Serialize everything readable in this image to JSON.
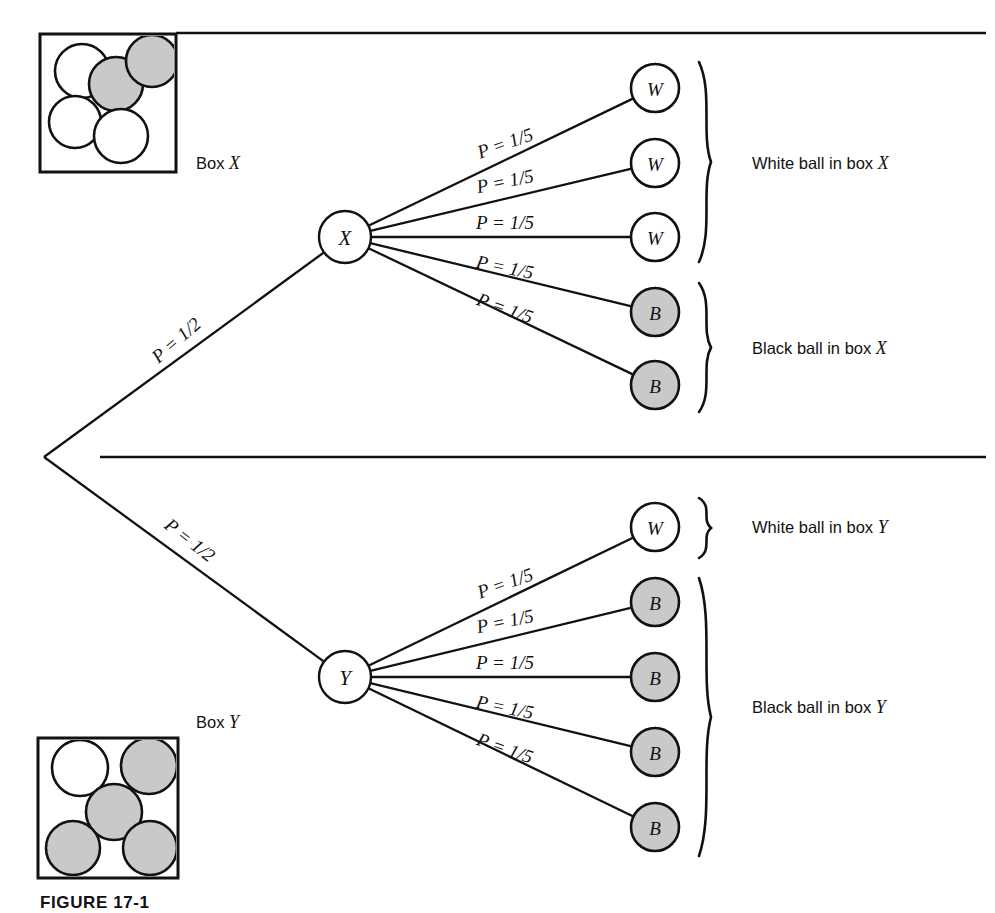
{
  "figure": {
    "caption": "FIGURE 17-1"
  },
  "colors": {
    "ink": "#111111",
    "paper": "#ffffff",
    "black_ball_fill": "#c9c9c9",
    "white_ball_fill": "#ffffff"
  },
  "boxes": [
    {
      "id": "box-x",
      "label": "Box X",
      "label_name": "Box",
      "label_italic": "X",
      "balls": [
        {
          "color": "white",
          "cx": 82,
          "cy": 71,
          "r": 27
        },
        {
          "color": "white",
          "cx": 75,
          "cy": 122,
          "r": 26
        },
        {
          "color": "black",
          "cx": 116,
          "cy": 84,
          "r": 27
        },
        {
          "color": "black",
          "cx": 152,
          "cy": 61,
          "r": 26
        },
        {
          "color": "white",
          "cx": 121,
          "cy": 136,
          "r": 27
        }
      ]
    },
    {
      "id": "box-y",
      "label": "Box Y",
      "label_name": "Box",
      "label_italic": "Y",
      "balls": [
        {
          "color": "white",
          "cx": 80,
          "cy": 768,
          "r": 28
        },
        {
          "color": "black",
          "cx": 149,
          "cy": 766,
          "r": 28
        },
        {
          "color": "black",
          "cx": 114,
          "cy": 812,
          "r": 28
        },
        {
          "color": "black",
          "cx": 73,
          "cy": 848,
          "r": 27
        },
        {
          "color": "black",
          "cx": 150,
          "cy": 848,
          "r": 27
        }
      ]
    }
  ],
  "dividers": [
    {
      "name": "top-divider",
      "x1": 176,
      "y1": 33,
      "x2": 986,
      "y2": 33
    },
    {
      "name": "middle-divider",
      "x1": 100,
      "y1": 457,
      "x2": 986,
      "y2": 457
    }
  ],
  "root": {
    "x": 44,
    "y": 457
  },
  "first_stage": [
    {
      "id": "branch-to-x",
      "label": "P = 1/2",
      "probability": "1/2",
      "to_node": "X",
      "label_x": 176,
      "label_y": 340,
      "rotation": -41
    },
    {
      "id": "branch-to-y",
      "label": "P = 1/2",
      "probability": "1/2",
      "to_node": "Y",
      "label_x": 190,
      "label_y": 540,
      "rotation": 38
    }
  ],
  "nodes": [
    {
      "id": "node-x",
      "letter": "X",
      "cx": 345,
      "cy": 237,
      "r": 26
    },
    {
      "id": "node-y",
      "letter": "Y",
      "cx": 345,
      "cy": 677,
      "r": 26
    }
  ],
  "upper_branches": {
    "from_node": "X",
    "items": [
      {
        "index": 1,
        "label": "P = 1/5",
        "probability": "1/5",
        "outcome": "W",
        "ball": "white",
        "tx": 655,
        "ty": 88,
        "lx": 505,
        "ly": 143,
        "rot": -19.5
      },
      {
        "index": 2,
        "label": "P = 1/5",
        "probability": "1/5",
        "outcome": "W",
        "ball": "white",
        "tx": 655,
        "ty": 163,
        "lx": 505,
        "ly": 181,
        "rot": -11.5
      },
      {
        "index": 3,
        "label": "P = 1/5",
        "probability": "1/5",
        "outcome": "W",
        "ball": "white",
        "tx": 655,
        "ty": 237,
        "lx": 505,
        "ly": 222,
        "rot": 0
      },
      {
        "index": 4,
        "label": "P = 1/5",
        "probability": "1/5",
        "outcome": "B",
        "ball": "black",
        "tx": 655,
        "ty": 312,
        "lx": 505,
        "ly": 267,
        "rot": 11.5
      },
      {
        "index": 5,
        "label": "P = 1/5",
        "probability": "1/5",
        "outcome": "B",
        "ball": "black",
        "tx": 655,
        "ty": 385,
        "lx": 505,
        "ly": 308,
        "rot": 19.5
      }
    ]
  },
  "lower_branches": {
    "from_node": "Y",
    "items": [
      {
        "index": 1,
        "label": "P = 1/5",
        "probability": "1/5",
        "outcome": "W",
        "ball": "white",
        "tx": 655,
        "ty": 527,
        "lx": 505,
        "ly": 583,
        "rot": -19.5
      },
      {
        "index": 2,
        "label": "P = 1/5",
        "probability": "1/5",
        "outcome": "B",
        "ball": "black",
        "tx": 655,
        "ty": 602,
        "lx": 505,
        "ly": 621,
        "rot": -11.5
      },
      {
        "index": 3,
        "label": "P = 1/5",
        "probability": "1/5",
        "outcome": "B",
        "ball": "black",
        "tx": 655,
        "ty": 677,
        "lx": 505,
        "ly": 662,
        "rot": 0
      },
      {
        "index": 4,
        "label": "P = 1/5",
        "probability": "1/5",
        "outcome": "B",
        "ball": "black",
        "tx": 655,
        "ty": 752,
        "lx": 505,
        "ly": 707,
        "rot": 11.5
      },
      {
        "index": 5,
        "label": "P = 1/5",
        "probability": "1/5",
        "outcome": "B",
        "ball": "black",
        "tx": 655,
        "ty": 827,
        "lx": 505,
        "ly": 748,
        "rot": 19.5
      }
    ]
  },
  "outcome_groups": [
    {
      "id": "group-white-x",
      "prefix": "White ball in box ",
      "italic": "X",
      "full_text": "White ball in box X",
      "brace_top": 62,
      "brace_bottom": 262,
      "label_x": 752,
      "label_y": 163
    },
    {
      "id": "group-black-x",
      "prefix": "Black ball in box ",
      "italic": "X",
      "full_text": "Black ball in box X",
      "brace_top": 283,
      "brace_bottom": 412,
      "label_x": 752,
      "label_y": 348
    },
    {
      "id": "group-white-y",
      "prefix": "White ball in box ",
      "italic": "Y",
      "full_text": "White ball in box Y",
      "brace_top": 498,
      "brace_bottom": 558,
      "label_x": 752,
      "label_y": 527
    },
    {
      "id": "group-black-y",
      "prefix": "Black ball in box ",
      "italic": "Y",
      "full_text": "Black ball in box Y",
      "brace_top": 578,
      "brace_bottom": 856,
      "label_x": 752,
      "label_y": 707
    }
  ],
  "chart_data": {
    "type": "diagram",
    "stages": [
      {
        "name": "Box selection",
        "outcomes": [
          {
            "label": "X",
            "probability": 0.5,
            "probability_text": "P = 1/2"
          },
          {
            "label": "Y",
            "probability": 0.5,
            "probability_text": "P = 1/2"
          }
        ]
      },
      {
        "name": "Ball drawn from box X",
        "outcomes": [
          {
            "label": "W",
            "probability": 0.2,
            "probability_text": "P = 1/5"
          },
          {
            "label": "W",
            "probability": 0.2,
            "probability_text": "P = 1/5"
          },
          {
            "label": "W",
            "probability": 0.2,
            "probability_text": "P = 1/5"
          },
          {
            "label": "B",
            "probability": 0.2,
            "probability_text": "P = 1/5"
          },
          {
            "label": "B",
            "probability": 0.2,
            "probability_text": "P = 1/5"
          }
        ]
      },
      {
        "name": "Ball drawn from box Y",
        "outcomes": [
          {
            "label": "W",
            "probability": 0.2,
            "probability_text": "P = 1/5"
          },
          {
            "label": "B",
            "probability": 0.2,
            "probability_text": "P = 1/5"
          },
          {
            "label": "B",
            "probability": 0.2,
            "probability_text": "P = 1/5"
          },
          {
            "label": "B",
            "probability": 0.2,
            "probability_text": "P = 1/5"
          },
          {
            "label": "B",
            "probability": 0.2,
            "probability_text": "P = 1/5"
          }
        ]
      }
    ],
    "box_contents": {
      "X": {
        "white": 3,
        "black": 2,
        "total": 5
      },
      "Y": {
        "white": 1,
        "black": 4,
        "total": 5
      }
    },
    "joint_outcomes": [
      {
        "label": "White ball in box X",
        "probability": 0.3
      },
      {
        "label": "Black ball in box X",
        "probability": 0.2
      },
      {
        "label": "White ball in box Y",
        "probability": 0.1
      },
      {
        "label": "Black ball in box Y",
        "probability": 0.4
      }
    ]
  }
}
